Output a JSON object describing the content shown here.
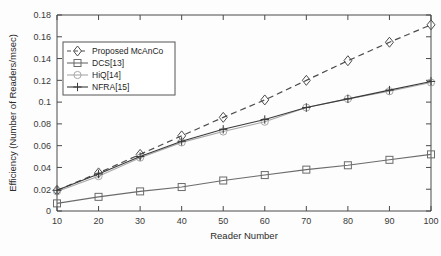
{
  "chart_data": {
    "type": "line",
    "title": "",
    "xlabel": "Reader Number",
    "ylabel": "Efficiency (Number of Readers/msec)",
    "x": [
      10,
      20,
      30,
      40,
      50,
      60,
      70,
      80,
      90,
      100
    ],
    "xlim": [
      10,
      100
    ],
    "ylim": [
      0,
      0.18
    ],
    "xticks": [
      "10",
      "20",
      "30",
      "40",
      "50",
      "60",
      "70",
      "80",
      "90",
      "100"
    ],
    "yticks": [
      "0",
      "0.02",
      "0.04",
      "0.06",
      "0.08",
      "0.1",
      "0.12",
      "0.14",
      "0.16",
      "0.18"
    ],
    "ytick_values": [
      0,
      0.02,
      0.04,
      0.06,
      0.08,
      0.1,
      0.12,
      0.14,
      0.16,
      0.18
    ],
    "grid": false,
    "legend_position": "upper-left",
    "series": [
      {
        "name": "Proposed McAnCo",
        "marker": "diamond",
        "linestyle": "dashed",
        "color": "#4d4d4d",
        "values": [
          0.019,
          0.035,
          0.052,
          0.069,
          0.086,
          0.102,
          0.12,
          0.138,
          0.155,
          0.171
        ]
      },
      {
        "name": "DCS[13]",
        "marker": "square",
        "linestyle": "solid",
        "color": "#6b6b6b",
        "values": [
          0.007,
          0.013,
          0.018,
          0.022,
          0.028,
          0.033,
          0.038,
          0.042,
          0.047,
          0.052
        ]
      },
      {
        "name": "HiQ[14]",
        "marker": "circle",
        "linestyle": "solid",
        "color": "#a8a8a8",
        "values": [
          0.018,
          0.032,
          0.049,
          0.063,
          0.073,
          0.082,
          0.095,
          0.103,
          0.11,
          0.118
        ]
      },
      {
        "name": "NFRA[15]",
        "marker": "plus",
        "linestyle": "solid",
        "color": "#3a3a3a",
        "values": [
          0.019,
          0.034,
          0.05,
          0.064,
          0.075,
          0.084,
          0.095,
          0.103,
          0.111,
          0.119
        ]
      }
    ]
  }
}
